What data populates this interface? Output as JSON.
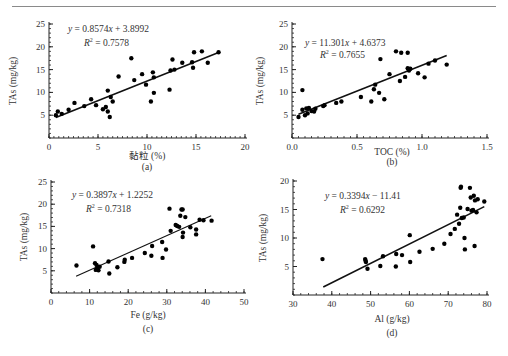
{
  "page": {
    "header_rule": true
  },
  "chart_data": [
    {
      "id": "a",
      "type": "scatter",
      "panel_label": "(a)",
      "xlabel": "黏粒 (%)",
      "ylabel": "TAs (mg/kg)",
      "xlim": [
        0,
        20
      ],
      "ylim": [
        0,
        25
      ],
      "xticks": [
        "0",
        "5",
        "10",
        "15",
        "20"
      ],
      "yticks": [
        "5",
        "10",
        "15",
        "20",
        "25"
      ],
      "equation": "y = 0.8574x + 3.8992",
      "r2": "R² = 0.7578",
      "fit": {
        "slope": 0.8574,
        "intercept": 3.8992,
        "x_range": [
          0.7,
          17.3
        ]
      },
      "points": [
        [
          0.7,
          5.0
        ],
        [
          0.9,
          5.8
        ],
        [
          1.3,
          5.3
        ],
        [
          2.0,
          6.2
        ],
        [
          2.6,
          7.7
        ],
        [
          3.6,
          7.0
        ],
        [
          4.3,
          8.5
        ],
        [
          4.8,
          7.2
        ],
        [
          5.5,
          6.3
        ],
        [
          5.8,
          6.8
        ],
        [
          6.0,
          5.8
        ],
        [
          6.0,
          10.4
        ],
        [
          6.2,
          4.6
        ],
        [
          6.3,
          9.0
        ],
        [
          6.5,
          8.0
        ],
        [
          7.1,
          13.5
        ],
        [
          8.4,
          17.5
        ],
        [
          8.7,
          12.7
        ],
        [
          9.5,
          14.0
        ],
        [
          9.9,
          11.7
        ],
        [
          10.4,
          8.0
        ],
        [
          10.6,
          14.4
        ],
        [
          10.7,
          9.9
        ],
        [
          10.7,
          13.3
        ],
        [
          12.3,
          10.6
        ],
        [
          12.4,
          14.8
        ],
        [
          12.6,
          17.2
        ],
        [
          12.8,
          15.0
        ],
        [
          13.6,
          16.5
        ],
        [
          14.6,
          16.6
        ],
        [
          14.7,
          15.4
        ],
        [
          14.8,
          18.8
        ],
        [
          15.6,
          19.0
        ],
        [
          16.2,
          16.5
        ],
        [
          17.3,
          18.8
        ]
      ]
    },
    {
      "id": "b",
      "type": "scatter",
      "panel_label": "(b)",
      "xlabel": "TOC (%)",
      "ylabel": "TAs (mg/kg)",
      "xlim": [
        0,
        1.5
      ],
      "ylim": [
        0,
        25
      ],
      "xticks": [
        "0.0",
        "0.5",
        "1.0",
        "1.5"
      ],
      "yticks": [
        "5",
        "10",
        "15",
        "20",
        "25"
      ],
      "equation": "y = 11.301x + 4.6373",
      "r2": "R² = 0.7655",
      "fit": {
        "slope": 11.301,
        "intercept": 4.6373,
        "x_range": [
          0.05,
          1.19
        ]
      },
      "points": [
        [
          0.05,
          4.6
        ],
        [
          0.08,
          10.5
        ],
        [
          0.08,
          6.2
        ],
        [
          0.1,
          5.0
        ],
        [
          0.11,
          6.5
        ],
        [
          0.12,
          5.4
        ],
        [
          0.13,
          6.6
        ],
        [
          0.15,
          5.9
        ],
        [
          0.17,
          5.8
        ],
        [
          0.18,
          6.4
        ],
        [
          0.24,
          7.0
        ],
        [
          0.25,
          7.2
        ],
        [
          0.34,
          7.7
        ],
        [
          0.38,
          8.0
        ],
        [
          0.53,
          9.0
        ],
        [
          0.61,
          8.0
        ],
        [
          0.63,
          10.7
        ],
        [
          0.64,
          11.7
        ],
        [
          0.67,
          9.9
        ],
        [
          0.68,
          17.3
        ],
        [
          0.71,
          8.5
        ],
        [
          0.75,
          14.0
        ],
        [
          0.8,
          19.0
        ],
        [
          0.83,
          12.5
        ],
        [
          0.84,
          18.7
        ],
        [
          0.87,
          13.4
        ],
        [
          0.89,
          18.7
        ],
        [
          0.89,
          15.3
        ],
        [
          0.9,
          14.8
        ],
        [
          0.91,
          15.2
        ],
        [
          0.97,
          14.2
        ],
        [
          1.02,
          13.3
        ],
        [
          1.05,
          16.3
        ],
        [
          1.1,
          17.0
        ],
        [
          1.19,
          16.1
        ]
      ]
    },
    {
      "id": "c",
      "type": "scatter",
      "panel_label": "(c)",
      "xlabel": "Fe (g/kg)",
      "ylabel": "TAs (mg/kg)",
      "xlim": [
        0,
        50
      ],
      "ylim": [
        0,
        25
      ],
      "xticks": [
        "0",
        "10",
        "20",
        "30",
        "40",
        "50"
      ],
      "yticks": [
        "5",
        "10",
        "15",
        "20",
        "25"
      ],
      "equation": "y = 0.3897x + 1.2252",
      "r2": "R² = 0.7318",
      "fit": {
        "slope": 0.3897,
        "intercept": 1.2252,
        "x_range": [
          6.5,
          41.5
        ]
      },
      "points": [
        [
          6.6,
          6.2
        ],
        [
          10.9,
          10.5
        ],
        [
          11.4,
          6.7
        ],
        [
          11.6,
          5.2
        ],
        [
          11.8,
          6.3
        ],
        [
          12.0,
          5.5
        ],
        [
          12.3,
          5.1
        ],
        [
          12.6,
          5.9
        ],
        [
          14.9,
          7.1
        ],
        [
          15.1,
          4.4
        ],
        [
          17.2,
          5.8
        ],
        [
          19.0,
          7.0
        ],
        [
          19.1,
          7.5
        ],
        [
          21.0,
          7.9
        ],
        [
          24.3,
          9.0
        ],
        [
          26.0,
          8.4
        ],
        [
          26.2,
          10.6
        ],
        [
          28.8,
          11.5
        ],
        [
          28.9,
          7.9
        ],
        [
          29.8,
          9.8
        ],
        [
          30.7,
          19.0
        ],
        [
          31.0,
          14.0
        ],
        [
          32.3,
          15.3
        ],
        [
          32.7,
          15.1
        ],
        [
          33.2,
          14.9
        ],
        [
          33.5,
          17.4
        ],
        [
          33.8,
          18.8
        ],
        [
          34.1,
          18.8
        ],
        [
          34.1,
          12.6
        ],
        [
          34.2,
          13.6
        ],
        [
          34.8,
          17.1
        ],
        [
          36.1,
          14.8
        ],
        [
          37.6,
          14.3
        ],
        [
          37.6,
          13.2
        ],
        [
          38.5,
          16.5
        ],
        [
          39.5,
          16.4
        ],
        [
          41.6,
          16.3
        ]
      ]
    },
    {
      "id": "d",
      "type": "scatter",
      "panel_label": "(d)",
      "xlabel": "Al (g/kg)",
      "ylabel": "TAs (mg/kg)",
      "xlim": [
        30,
        80
      ],
      "ylim": [
        0,
        20
      ],
      "xticks": [
        "30",
        "40",
        "50",
        "60",
        "70",
        "80"
      ],
      "yticks": [
        "5",
        "10",
        "15",
        "20"
      ],
      "equation": "y = 0.3394x − 11.41",
      "r2": "R² = 0.6292",
      "fit": {
        "slope": 0.3394,
        "intercept": -11.41,
        "x_range": [
          37.8,
          79.3
        ]
      },
      "points": [
        [
          37.6,
          6.3
        ],
        [
          48.6,
          6.3
        ],
        [
          48.7,
          6.0
        ],
        [
          48.8,
          5.8
        ],
        [
          49.2,
          4.6
        ],
        [
          52.5,
          5.1
        ],
        [
          53.2,
          6.8
        ],
        [
          56.5,
          5.0
        ],
        [
          56.6,
          7.2
        ],
        [
          58.1,
          7.0
        ],
        [
          60.1,
          10.5
        ],
        [
          60.2,
          5.8
        ],
        [
          62.6,
          7.6
        ],
        [
          66.0,
          8.1
        ],
        [
          69.0,
          9.0
        ],
        [
          70.6,
          10.7
        ],
        [
          71.7,
          11.6
        ],
        [
          72.3,
          14.1
        ],
        [
          72.8,
          12.5
        ],
        [
          73.1,
          15.3
        ],
        [
          73.2,
          18.8
        ],
        [
          73.3,
          19.0
        ],
        [
          73.5,
          13.5
        ],
        [
          74.0,
          13.6
        ],
        [
          74.2,
          10.0
        ],
        [
          74.3,
          8.0
        ],
        [
          75.0,
          15.1
        ],
        [
          75.6,
          18.8
        ],
        [
          75.8,
          17.1
        ],
        [
          76.0,
          14.8
        ],
        [
          76.4,
          14.9
        ],
        [
          76.6,
          17.4
        ],
        [
          76.8,
          8.6
        ],
        [
          76.9,
          16.6
        ],
        [
          77.3,
          14.5
        ],
        [
          77.6,
          16.8
        ],
        [
          79.3,
          16.4
        ]
      ]
    }
  ]
}
